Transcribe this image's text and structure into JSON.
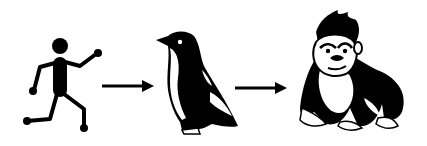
{
  "diagram": {
    "type": "evolution-sequence",
    "stages": [
      {
        "id": "stick-figure",
        "label": "Running stick figure"
      },
      {
        "id": "penguin",
        "label": "Penguin"
      },
      {
        "id": "gorilla",
        "label": "Gorilla"
      }
    ],
    "connectors": [
      {
        "from": "stick-figure",
        "to": "penguin",
        "type": "arrow"
      },
      {
        "from": "penguin",
        "to": "gorilla",
        "type": "arrow"
      }
    ],
    "colors": {
      "ink": "#000000",
      "background": "#ffffff"
    }
  }
}
